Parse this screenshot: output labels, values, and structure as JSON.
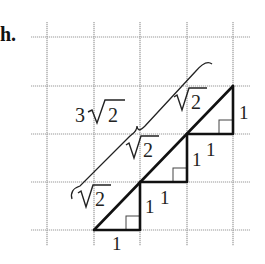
{
  "part_label": "h.",
  "grid": {
    "x_lines": [
      47,
      94,
      140,
      187,
      233
    ],
    "y_lines": [
      37,
      86,
      134,
      182,
      230
    ],
    "x_extent": [
      31,
      250
    ],
    "y_extent": [
      22,
      246
    ]
  },
  "triangles": [
    {
      "leg_horizontal": "1",
      "leg_vertical": "1",
      "hypotenuse": "√2"
    },
    {
      "leg_horizontal": "1",
      "leg_vertical": "1",
      "hypotenuse": "√2"
    },
    {
      "leg_horizontal": "1",
      "leg_vertical": "1",
      "hypotenuse": "√2"
    }
  ],
  "labels": {
    "total": "3√2",
    "total_coef": "3",
    "radicand": "2",
    "hyp": "√2",
    "one": "1"
  },
  "colors": {
    "grid": "#9a9a9a",
    "lines": "#111111"
  }
}
